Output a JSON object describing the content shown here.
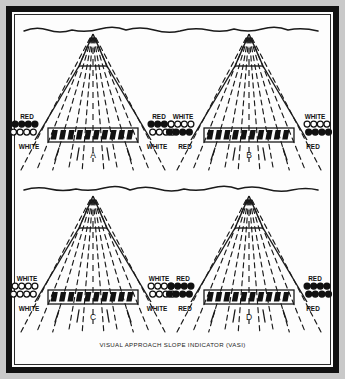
{
  "figure": {
    "caption": "VISUAL APPROACH SLOPE INDICATOR (VASI)",
    "border_color": "#111111",
    "background_color": "#fdfdfd"
  },
  "chart_data": {
    "type": "diagram",
    "title": "VISUAL APPROACH SLOPE INDICATOR (VASI)",
    "panel_count": 4,
    "layout": "2x2 grid",
    "legend": {
      "filled_circle_means": "RED",
      "open_circle_means": "WHITE"
    },
    "panels": [
      {
        "letter": "A",
        "left_unit": {
          "upper_label": "RED",
          "upper_state": "red",
          "lower_label": "WHITE",
          "lower_state": "white"
        },
        "right_unit": {
          "upper_label": "RED",
          "upper_state": "red",
          "lower_label": "WHITE",
          "lower_state": "white"
        },
        "lights_per_row": 4
      },
      {
        "letter": "B",
        "left_unit": {
          "upper_label": "WHITE",
          "upper_state": "white",
          "lower_label": "RED",
          "lower_state": "red"
        },
        "right_unit": {
          "upper_label": "WHITE",
          "upper_state": "white",
          "lower_label": "RED",
          "lower_state": "red"
        },
        "lights_per_row": 4
      },
      {
        "letter": "C",
        "left_unit": {
          "upper_label": "WHITE",
          "upper_state": "white",
          "lower_label": "WHITE",
          "lower_state": "white"
        },
        "right_unit": {
          "upper_label": "WHITE",
          "upper_state": "white",
          "lower_label": "WHITE",
          "lower_state": "white"
        },
        "lights_per_row": 4
      },
      {
        "letter": "D",
        "left_unit": {
          "upper_label": "RED",
          "upper_state": "red",
          "lower_label": "RED",
          "lower_state": "red"
        },
        "right_unit": {
          "upper_label": "RED",
          "upper_state": "red",
          "lower_label": "RED",
          "lower_state": "red"
        },
        "lights_per_row": 4
      }
    ],
    "runway_bar_segments": 10,
    "horizon_lines": 2
  }
}
